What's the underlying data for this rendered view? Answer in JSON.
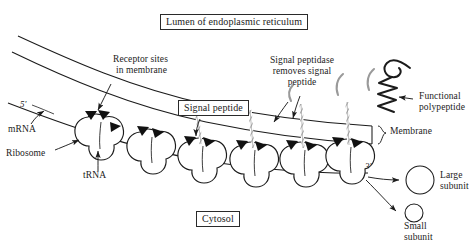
{
  "figure": {
    "title": "Lumen of endoplasmic reticulum",
    "width": 471,
    "height": 248,
    "background_color": "#ffffff",
    "ink_color": "#1b1b1b",
    "polypeptide_color": "#8a8a8a"
  },
  "labels": {
    "lumen": "Lumen of endoplasmic reticulum",
    "cytosol": "Cytosol",
    "signal_peptide": "Signal peptide",
    "receptor_sites_line1": "Receptor sites",
    "receptor_sites_line2": "in membrane",
    "signal_peptidase_line1": "Signal peptidase",
    "signal_peptidase_line2": "removes signal",
    "signal_peptidase_line3": "peptide",
    "functional_line1": "Functional",
    "functional_line2": "polypeptide",
    "membrane": "Membrane",
    "mrna": "mRNA",
    "ribosome": "Ribosome",
    "trna": "tRNA",
    "five_prime": "5'",
    "three_prime": "3'",
    "large_subunit_line1": "Large",
    "large_subunit_line2": "subunit",
    "small_subunit_line1": "Small",
    "small_subunit_line2": "subunit"
  },
  "diagram_elements": {
    "ribosome_count": 6,
    "ribosomes": [
      {
        "name": "ribosome-1",
        "cx": 97,
        "cy": 133
      },
      {
        "name": "ribosome-2",
        "cx": 148,
        "cy": 147
      },
      {
        "name": "ribosome-3",
        "cx": 199,
        "cy": 155
      },
      {
        "name": "ribosome-4",
        "cx": 251,
        "cy": 159
      },
      {
        "name": "ribosome-5",
        "cx": 301,
        "cy": 159
      },
      {
        "name": "ribosome-6",
        "cx": 347,
        "cy": 156
      }
    ],
    "subunits": [
      {
        "name": "large-subunit-circle",
        "cx": 420,
        "cy": 180,
        "r": 14
      },
      {
        "name": "small-subunit-circle",
        "cx": 414,
        "cy": 213,
        "r": 9
      }
    ],
    "boxed_labels": [
      "Lumen of endoplasmic reticulum",
      "Signal peptide",
      "Cytosol"
    ]
  }
}
